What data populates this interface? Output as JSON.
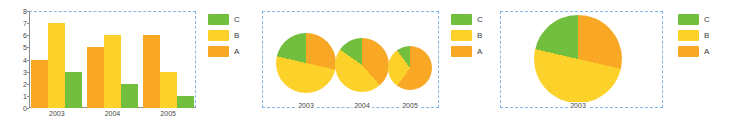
{
  "theme": {
    "color_a": "#F9A825",
    "color_b": "#FCD12A",
    "color_c": "#72BE3E",
    "selection_border": "#7fb6e8",
    "axis": "#8a8a8a",
    "text": "#4a4a4a",
    "background": "#ffffff"
  },
  "legend": {
    "items": [
      {
        "label": "C",
        "color": "#72BE3E",
        "series": "C"
      },
      {
        "label": "B",
        "color": "#FCD12A",
        "series": "B"
      },
      {
        "label": "A",
        "color": "#F9A825",
        "series": "A"
      }
    ]
  },
  "panels": [
    {
      "id": "bar-panel",
      "kind": "bar",
      "title": ""
    },
    {
      "id": "small-pies-panel",
      "kind": "pie-series",
      "title": ""
    },
    {
      "id": "large-pie-panel",
      "kind": "pie",
      "title": ""
    }
  ],
  "chart_data": [
    {
      "type": "bar",
      "title": "",
      "xlabel": "",
      "ylabel": "",
      "categories": [
        "2003",
        "2004",
        "2005"
      ],
      "series": [
        {
          "name": "A",
          "color": "#F9A825",
          "values": [
            4,
            5,
            6
          ]
        },
        {
          "name": "B",
          "color": "#FCD12A",
          "values": [
            7,
            6,
            3
          ]
        },
        {
          "name": "C",
          "color": "#72BE3E",
          "values": [
            3,
            2,
            1
          ]
        }
      ],
      "ylim": [
        0,
        8
      ],
      "yticks": [
        0,
        1,
        2,
        3,
        4,
        5,
        6,
        7,
        8
      ],
      "grid": false,
      "legend_position": "right"
    },
    {
      "type": "pie",
      "title": "",
      "categories": [
        "2003",
        "2004",
        "2005"
      ],
      "charts": [
        {
          "label": "2003",
          "total": 14,
          "radius_px": 30,
          "slices": [
            {
              "name": "A",
              "color": "#F9A825",
              "value": 4,
              "percent": 28.6
            },
            {
              "name": "B",
              "color": "#FCD12A",
              "value": 7,
              "percent": 50.0
            },
            {
              "name": "C",
              "color": "#72BE3E",
              "value": 3,
              "percent": 21.4
            }
          ]
        },
        {
          "label": "2004",
          "total": 13,
          "radius_px": 27,
          "slices": [
            {
              "name": "A",
              "color": "#F9A825",
              "value": 5,
              "percent": 38.5
            },
            {
              "name": "B",
              "color": "#FCD12A",
              "value": 6,
              "percent": 46.2
            },
            {
              "name": "C",
              "color": "#72BE3E",
              "value": 2,
              "percent": 15.4
            }
          ]
        },
        {
          "label": "2005",
          "total": 10,
          "radius_px": 22,
          "slices": [
            {
              "name": "A",
              "color": "#F9A825",
              "value": 6,
              "percent": 60.0
            },
            {
              "name": "B",
              "color": "#FCD12A",
              "value": 3,
              "percent": 30.0
            },
            {
              "name": "C",
              "color": "#72BE3E",
              "value": 1,
              "percent": 10.0
            }
          ]
        }
      ],
      "legend_position": "right"
    },
    {
      "type": "pie",
      "title": "",
      "categories": [
        "2003"
      ],
      "charts": [
        {
          "label": "2003",
          "total": 14,
          "radius_px": 44,
          "slices": [
            {
              "name": "A",
              "color": "#F9A825",
              "value": 4,
              "percent": 28.6
            },
            {
              "name": "B",
              "color": "#FCD12A",
              "value": 7,
              "percent": 50.0
            },
            {
              "name": "C",
              "color": "#72BE3E",
              "value": 3,
              "percent": 21.4
            }
          ]
        }
      ],
      "legend_position": "right"
    }
  ]
}
